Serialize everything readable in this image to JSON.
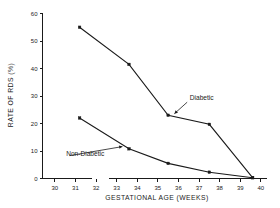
{
  "chart_data": {
    "type": "line",
    "title": "",
    "xlabel": "GESTATIONAL AGE (WEEKS)",
    "ylabel": "RATE OF RDS (%)",
    "xlim": [
      29.4,
      40.3
    ],
    "ylim": [
      0,
      60
    ],
    "grid": false,
    "legend_position": "inline-annotations",
    "x_ticks": [
      "30",
      "31",
      "32",
      "33",
      "34",
      "35",
      "36",
      "37",
      "38",
      "39",
      "40"
    ],
    "x_tick_values": [
      30,
      31,
      32,
      33,
      34,
      35,
      36,
      37,
      38,
      39,
      40
    ],
    "y_ticks": [
      "0",
      "10",
      "20",
      "30",
      "40",
      "50",
      "60"
    ],
    "y_tick_values": [
      0,
      10,
      20,
      30,
      40,
      50,
      60
    ],
    "axis_break": {
      "after": 32,
      "before": 33
    },
    "x": [
      31.2,
      33.6,
      35.5,
      37.5,
      39.6
    ],
    "series": [
      {
        "name": "Diabetic",
        "values": [
          55,
          41.5,
          23,
          19.7,
          0.3
        ],
        "marker": "square",
        "color": "#1a1a1a"
      },
      {
        "name": "Non-Diabetic",
        "values": [
          22,
          10.8,
          5.5,
          2.3,
          0.3
        ],
        "marker": "square",
        "color": "#1a1a1a"
      }
    ],
    "annotations": [
      {
        "label": "Diabetic",
        "text_x": 36.55,
        "text_y": 28.6,
        "point_x": 35.75,
        "point_y": 23.2
      },
      {
        "label": "Non-Diabetic",
        "text_x": 30.55,
        "text_y": 8.1,
        "point_x": 33.35,
        "point_y": 11.7
      }
    ]
  },
  "axes": {
    "y_axis_title": "RATE OF RDS (%)",
    "x_axis_title": "GESTATIONAL AGE (WEEKS)"
  }
}
